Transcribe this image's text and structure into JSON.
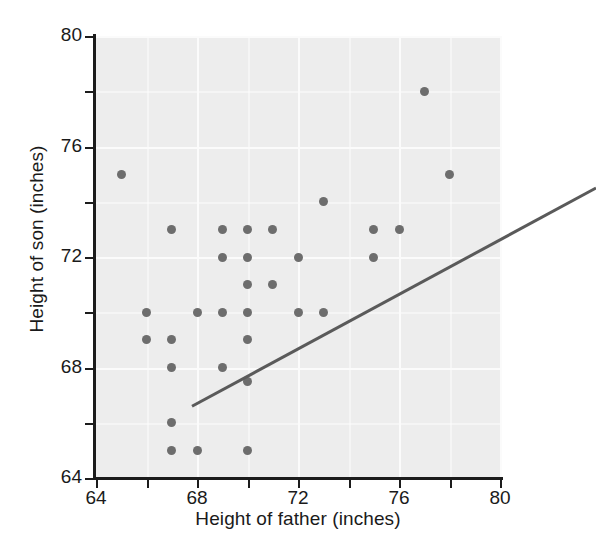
{
  "chart_data": {
    "type": "scatter",
    "title": "",
    "xlabel": "Height of father (inches)",
    "ylabel": "Height of son (inches)",
    "xlim": [
      64,
      80
    ],
    "ylim": [
      64,
      80
    ],
    "xticks": [
      64,
      68,
      72,
      76,
      80
    ],
    "yticks": [
      64,
      68,
      72,
      76,
      80
    ],
    "xtick_labels": [
      "64",
      "68",
      "72",
      "76",
      "80"
    ],
    "ytick_labels": [
      "64",
      "68",
      "72",
      "76",
      "80"
    ],
    "grid": true,
    "legend": "none",
    "point_color": "#6d6d6d",
    "line_color": "#5a5a5a",
    "plot_background": "#ededed",
    "gridline_color": "#fbfbfb",
    "axis_color": "#1c1c1c",
    "points": [
      {
        "x": 65,
        "y": 75
      },
      {
        "x": 66,
        "y": 70
      },
      {
        "x": 66,
        "y": 69
      },
      {
        "x": 67,
        "y": 73
      },
      {
        "x": 67,
        "y": 69
      },
      {
        "x": 67,
        "y": 68
      },
      {
        "x": 67,
        "y": 66
      },
      {
        "x": 67,
        "y": 65
      },
      {
        "x": 68,
        "y": 70
      },
      {
        "x": 68,
        "y": 65
      },
      {
        "x": 69,
        "y": 73
      },
      {
        "x": 69,
        "y": 72
      },
      {
        "x": 69,
        "y": 70
      },
      {
        "x": 69,
        "y": 68
      },
      {
        "x": 70,
        "y": 73
      },
      {
        "x": 70,
        "y": 72
      },
      {
        "x": 70,
        "y": 71
      },
      {
        "x": 70,
        "y": 70
      },
      {
        "x": 70,
        "y": 69
      },
      {
        "x": 70,
        "y": 67.5
      },
      {
        "x": 70,
        "y": 65
      },
      {
        "x": 71,
        "y": 73
      },
      {
        "x": 71,
        "y": 71
      },
      {
        "x": 72,
        "y": 72
      },
      {
        "x": 72,
        "y": 70
      },
      {
        "x": 73,
        "y": 74
      },
      {
        "x": 73,
        "y": 70
      },
      {
        "x": 75,
        "y": 73
      },
      {
        "x": 75,
        "y": 72
      },
      {
        "x": 76,
        "y": 73
      },
      {
        "x": 77,
        "y": 78
      },
      {
        "x": 78,
        "y": 75
      }
    ],
    "fit_line": {
      "x_start": 64,
      "y_start": 67.9,
      "x_end": 80,
      "y_end": 75.8
    }
  }
}
